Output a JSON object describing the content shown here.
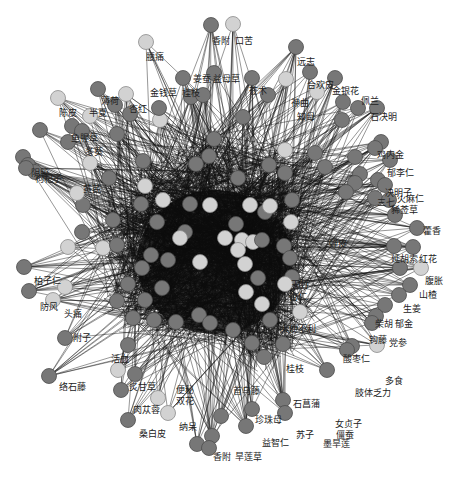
{
  "graph": {
    "type": "herb-symptom network",
    "colors": {
      "dark_node": "#777777",
      "light_node": "#d2d2d2",
      "edge": "#111111",
      "background": "#ffffff"
    },
    "labels": [
      {
        "id": "xiangfu",
        "text": "香附"
      },
      {
        "id": "kouku",
        "text": "口苦"
      },
      {
        "id": "yaotong",
        "text": "腰痛"
      },
      {
        "id": "yuanzhi",
        "text": "远志"
      },
      {
        "id": "hehuanpi",
        "text": "合欢皮"
      },
      {
        "id": "jinyinhua",
        "text": "金银花"
      },
      {
        "id": "peilan",
        "text": "佩兰"
      },
      {
        "id": "shijueming",
        "text": "石决明"
      },
      {
        "id": "shenqu",
        "text": "神曲"
      },
      {
        "id": "zhimu",
        "text": "知母"
      },
      {
        "id": "cangzhu",
        "text": "苍术"
      },
      {
        "id": "yiyiren",
        "text": "益母草"
      },
      {
        "id": "jiangcan",
        "text": "姜蚕"
      },
      {
        "id": "jinqiancao",
        "text": "金钱草"
      },
      {
        "id": "guizhi_top",
        "text": "桂枝"
      },
      {
        "id": "bohe",
        "text": "薄荷"
      },
      {
        "id": "xinghong",
        "text": "杏红"
      },
      {
        "id": "chenpi",
        "text": "陈皮"
      },
      {
        "id": "banxia",
        "text": "半夏"
      },
      {
        "id": "yuxingcao",
        "text": "鱼腥草"
      },
      {
        "id": "dongkui",
        "text": "冬葵"
      },
      {
        "id": "gouqizi",
        "text": "枸杞子"
      },
      {
        "id": "yinjiao",
        "text": "阴胶"
      },
      {
        "id": "huangqi",
        "text": "黄芪"
      },
      {
        "id": "jineijin",
        "text": "鸡内金"
      },
      {
        "id": "yuliren",
        "text": "郁李仁"
      },
      {
        "id": "juemingzi",
        "text": "决明子"
      },
      {
        "id": "huomaren",
        "text": "火麻仁"
      },
      {
        "id": "sanqi",
        "text": "三七"
      },
      {
        "id": "haojincao",
        "text": "豨莶草"
      },
      {
        "id": "huoxiang",
        "text": "藿香"
      },
      {
        "id": "chanpi",
        "text": "蝉皮"
      },
      {
        "id": "yanhusuo",
        "text": "延胡索"
      },
      {
        "id": "honghua",
        "text": "红花"
      },
      {
        "id": "fuzhang",
        "text": "腹胀"
      },
      {
        "id": "shanzha",
        "text": "山楂"
      },
      {
        "id": "shengjiang",
        "text": "生姜"
      },
      {
        "id": "chaihu",
        "text": "柴胡"
      },
      {
        "id": "yujin",
        "text": "郁金"
      },
      {
        "id": "gouteng",
        "text": "钩藤"
      },
      {
        "id": "dangshen",
        "text": "党参"
      },
      {
        "id": "suanzaoren",
        "text": "酸枣仁"
      },
      {
        "id": "duoshi",
        "text": "多食"
      },
      {
        "id": "zhitifali",
        "text": "肢体乏力"
      },
      {
        "id": "guizhi",
        "text": "桂枝"
      },
      {
        "id": "shichangpu",
        "text": "石菖蒲"
      },
      {
        "id": "nvzhenzi",
        "text": "女贞子"
      },
      {
        "id": "jiangcan2",
        "text": "僵蚕"
      },
      {
        "id": "zhuhuang",
        "text": "珍珠母"
      },
      {
        "id": "suzi",
        "text": "苏子"
      },
      {
        "id": "yizhiren",
        "text": "益智仁"
      },
      {
        "id": "hanliancao",
        "text": "墨旱莲"
      },
      {
        "id": "fuling",
        "text": "首乌藤"
      },
      {
        "id": "xiangling",
        "text": "香附"
      },
      {
        "id": "hanlian",
        "text": "旱莲草"
      },
      {
        "id": "naidai",
        "text": "纳呆"
      },
      {
        "id": "sangbaipi",
        "text": "桑白皮"
      },
      {
        "id": "roucongrong",
        "text": "肉苁蓉"
      },
      {
        "id": "zhigancao",
        "text": "炙甘草"
      },
      {
        "id": "bianbi",
        "text": "便秘"
      },
      {
        "id": "shuangjiang",
        "text": "双花"
      },
      {
        "id": "daibugongli",
        "text": "大便不利"
      },
      {
        "id": "luoshiteng",
        "text": "络石藤"
      },
      {
        "id": "fuzi",
        "text": "附子"
      },
      {
        "id": "fangfeng",
        "text": "防风"
      },
      {
        "id": "touteng",
        "text": "头痛"
      },
      {
        "id": "baiziren",
        "text": "柏子仁"
      },
      {
        "id": "shenggan",
        "text": "玉竹"
      },
      {
        "id": "xingren",
        "text": "杏仁"
      },
      {
        "id": "huoluo",
        "text": "活血"
      }
    ]
  }
}
